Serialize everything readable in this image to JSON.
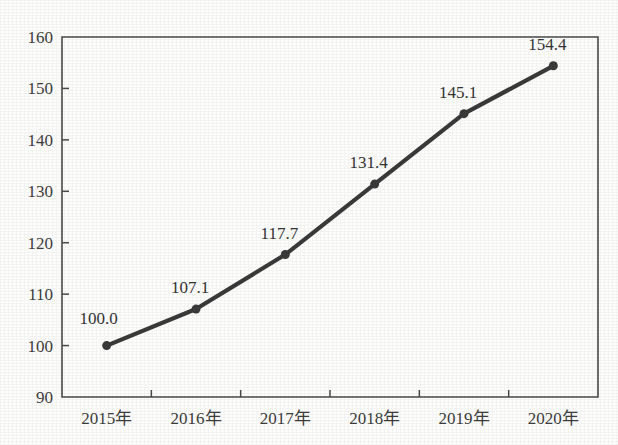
{
  "figure": {
    "background_color": "#fdfdfc",
    "top_cut_text": "· · · ·  · ··  ·   ·   · ·   ·"
  },
  "chart_data": {
    "type": "line",
    "title": "",
    "subtitle": "",
    "xlabel": "",
    "ylabel": "",
    "categories": [
      "2015年",
      "2016年",
      "2017年",
      "2018年",
      "2019年",
      "2020年"
    ],
    "values": [
      100.0,
      107.1,
      117.7,
      131.4,
      145.1,
      154.4
    ],
    "point_labels": [
      "100.0",
      "107.1",
      "117.7",
      "131.4",
      "145.1",
      "154.4"
    ],
    "ylim": [
      90,
      160
    ],
    "yticks": [
      90,
      100,
      110,
      120,
      130,
      140,
      150,
      160
    ],
    "ytick_labels": [
      "90",
      "100",
      "110",
      "120",
      "130",
      "140",
      "150",
      "160"
    ],
    "grid": false,
    "legend": null,
    "legend_position": "none",
    "series_color": "#3a3a3a",
    "marker": "circle",
    "marker_size": 9,
    "line_width": 4.2,
    "axis_color": "#4a4a4a"
  }
}
